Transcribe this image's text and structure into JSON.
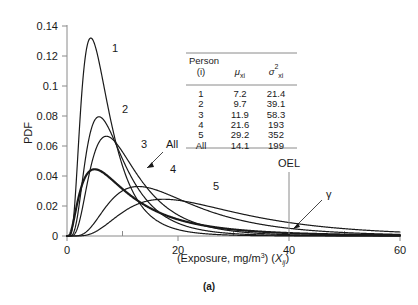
{
  "figure": {
    "caption": "(a)",
    "axis": {
      "ylabel": "PDF",
      "xlabel_main": "(Exposure, mg/m",
      "xlabel_sup": "3",
      "xlabel_mid": ") (",
      "xlabel_var": "X",
      "xlabel_varsub": "ij",
      "xlabel_end": ")",
      "xticks": [
        "0",
        "20",
        "40",
        "60"
      ],
      "yticks": [
        "0",
        "0.02",
        "0.04",
        "0.06",
        "0.08",
        "0.1",
        "0.12",
        "0.14"
      ]
    },
    "annotations": {
      "oel": "OEL",
      "gamma": "γ"
    },
    "curve_labels": [
      "1",
      "2",
      "3",
      "All",
      "4",
      "5"
    ],
    "table": {
      "headers": {
        "col1_line1": "Person",
        "col1_line2": "(i)",
        "col2_mu": "μ",
        "col2_sub": "xi",
        "col3_sigma": "σ",
        "col3_sup": "2",
        "col3_sub": "xi"
      },
      "rows": [
        {
          "person": "1",
          "mu": "7.2",
          "var": "21.4"
        },
        {
          "person": "2",
          "mu": "9.7",
          "var": "39.1"
        },
        {
          "person": "3",
          "mu": "11.9",
          "var": "58.3"
        },
        {
          "person": "4",
          "mu": "21.6",
          "var": "193"
        },
        {
          "person": "5",
          "mu": "29.2",
          "var": "352"
        },
        {
          "person": "All",
          "mu": "14.1",
          "var": "199"
        }
      ]
    },
    "colors": {
      "ink": "#1a1a1a",
      "axis": "#8a8a8a",
      "background": "#ffffff"
    }
  },
  "chart_data": {
    "type": "line",
    "title": "",
    "xlabel": "(Exposure, mg/m3) (Xij)",
    "ylabel": "PDF",
    "xlim": [
      0,
      60
    ],
    "ylim": [
      0,
      0.14
    ],
    "xticks": [
      0,
      20,
      40,
      60
    ],
    "xminorticks": [
      10,
      30,
      50
    ],
    "yticks": [
      0,
      0.02,
      0.04,
      0.06,
      0.08,
      0.1,
      0.12,
      0.14
    ],
    "grid": false,
    "legend": "inline-curve-labels",
    "distribution": "lognormal",
    "oel_value": 40,
    "series": [
      {
        "name": "1",
        "mean": 7.2,
        "variance": 21.4,
        "peak_x": 5.4,
        "peak_y": 0.132
      },
      {
        "name": "2",
        "mean": 9.7,
        "variance": 39.1,
        "peak_x": 7.6,
        "peak_y": 0.0795
      },
      {
        "name": "3",
        "mean": 11.9,
        "variance": 58.3,
        "peak_x": 9.4,
        "peak_y": 0.0665
      },
      {
        "name": "4",
        "mean": 21.6,
        "variance": 193,
        "peak_x": 16.8,
        "peak_y": 0.033
      },
      {
        "name": "5",
        "mean": 29.2,
        "variance": 352,
        "peak_x": 23.5,
        "peak_y": 0.0245
      },
      {
        "name": "All",
        "mean": 14.1,
        "variance": 199,
        "peak_x": 7.4,
        "peak_y": 0.0445,
        "emphasis": "thick"
      }
    ],
    "table": {
      "columns": [
        "Person (i)",
        "mu_xi",
        "sigma^2_xi"
      ],
      "rows": [
        [
          "1",
          7.2,
          21.4
        ],
        [
          "2",
          9.7,
          39.1
        ],
        [
          "3",
          11.9,
          58.3
        ],
        [
          "4",
          21.6,
          193
        ],
        [
          "5",
          29.2,
          352
        ],
        [
          "All",
          14.1,
          199
        ]
      ]
    }
  }
}
